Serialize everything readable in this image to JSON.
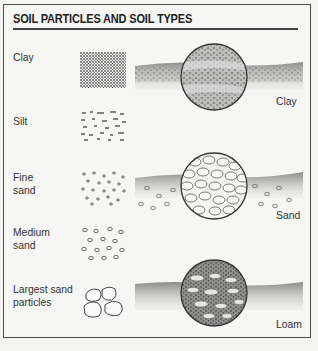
{
  "figure": {
    "title": "SOIL PARTICLES AND SOIL TYPES",
    "particles": [
      {
        "label_lines": [
          "Clay"
        ],
        "pattern": "dense-dots"
      },
      {
        "label_lines": [
          "Silt"
        ],
        "pattern": "dashes"
      },
      {
        "label_lines": [
          "Fine",
          "sand"
        ],
        "pattern": "tiny-ovals"
      },
      {
        "label_lines": [
          "Medium",
          "sand"
        ],
        "pattern": "small-ovals"
      },
      {
        "label_lines": [
          "Largest sand",
          "particles"
        ],
        "pattern": "large-pebbles"
      }
    ],
    "soil_types": [
      {
        "label": "Clay",
        "texture": "dark-layered"
      },
      {
        "label": "Sand",
        "texture": "light-pebbles"
      },
      {
        "label": "Loam",
        "texture": "mixed"
      }
    ]
  }
}
